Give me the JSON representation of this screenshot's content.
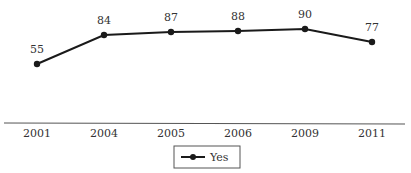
{
  "chart_data": {
    "type": "line",
    "title": "",
    "xlabel": "",
    "ylabel": "",
    "categories": [
      "2001",
      "2004",
      "2005",
      "2006",
      "2009",
      "2011"
    ],
    "series": [
      {
        "name": "Yes",
        "values": [
          55,
          84,
          87,
          88,
          90,
          77
        ],
        "color": "#1a1a1a"
      }
    ],
    "data_labels": [
      "55",
      "84",
      "87",
      "88",
      "90",
      "77"
    ],
    "legend": {
      "position": "bottom-center",
      "entries": [
        "Yes"
      ]
    },
    "grid": false,
    "ylim": [
      0,
      100
    ]
  }
}
